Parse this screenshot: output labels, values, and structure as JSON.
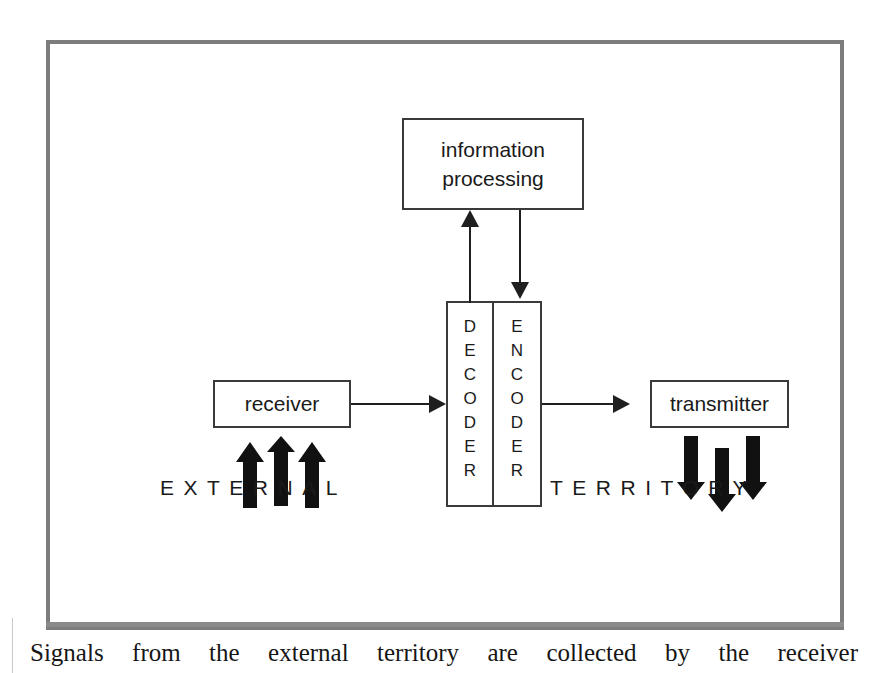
{
  "figure": {
    "frame_color": "#7d7d7d",
    "line_color": "#1f1f1f",
    "nodes": {
      "information_processing": {
        "line1": "information",
        "line2": "processing"
      },
      "receiver": {
        "label": "receiver"
      },
      "transmitter": {
        "label": "transmitter"
      },
      "decoder": {
        "label": "DECODER",
        "letters": [
          "D",
          "E",
          "C",
          "O",
          "D",
          "E",
          "R"
        ]
      },
      "encoder": {
        "label": "ENCODER",
        "letters": [
          "E",
          "N",
          "C",
          "O",
          "D",
          "E",
          "R"
        ]
      }
    },
    "environment_labels": {
      "left": "EXTERNAL",
      "right": "TERRITORY"
    },
    "flows": [
      {
        "from": "receiver",
        "to": "decoder",
        "direction": "right"
      },
      {
        "from": "decoder",
        "to": "information_processing",
        "direction": "up"
      },
      {
        "from": "information_processing",
        "to": "encoder",
        "direction": "down"
      },
      {
        "from": "encoder",
        "to": "transmitter",
        "direction": "right"
      }
    ],
    "signal_arrows": {
      "incoming": {
        "count": 3,
        "direction": "up",
        "target": "receiver"
      },
      "outgoing": {
        "count": 3,
        "direction": "down",
        "source": "transmitter"
      }
    }
  },
  "caption": {
    "text": "Signals from the external territory are collected by the receiver"
  }
}
